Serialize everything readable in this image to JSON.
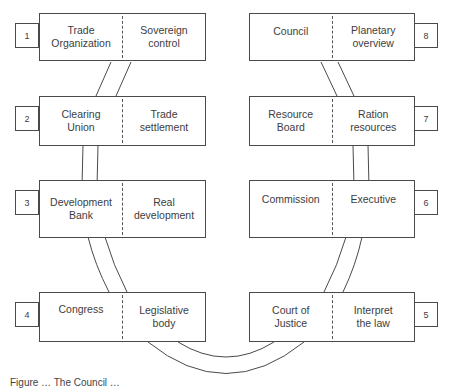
{
  "diagram": {
    "type": "ring-of-institutions",
    "left_column": [
      {
        "number": "1",
        "institution": "Trade\nOrganization",
        "function": "Sovereign\ncontrol"
      },
      {
        "number": "2",
        "institution": "Clearing\nUnion",
        "function": "Trade\nsettlement"
      },
      {
        "number": "3",
        "institution": "Development\nBank",
        "function": "Real\ndevelopment"
      },
      {
        "number": "4",
        "institution": "Congress",
        "function": "Legislative\nbody"
      }
    ],
    "right_column": [
      {
        "number": "8",
        "institution": "Council",
        "function": "Planetary\noverview"
      },
      {
        "number": "7",
        "institution": "Resource\nBoard",
        "function": "Ration\nresources"
      },
      {
        "number": "6",
        "institution": "Commission",
        "function": "Executive"
      },
      {
        "number": "5",
        "institution": "Court of\nJustice",
        "function": "Interpret\nthe law"
      }
    ],
    "caption": "Figure … The Council …",
    "colors": {
      "line": "#4a4a4a",
      "text": "#3d3d3d",
      "background": "#ffffff"
    }
  }
}
